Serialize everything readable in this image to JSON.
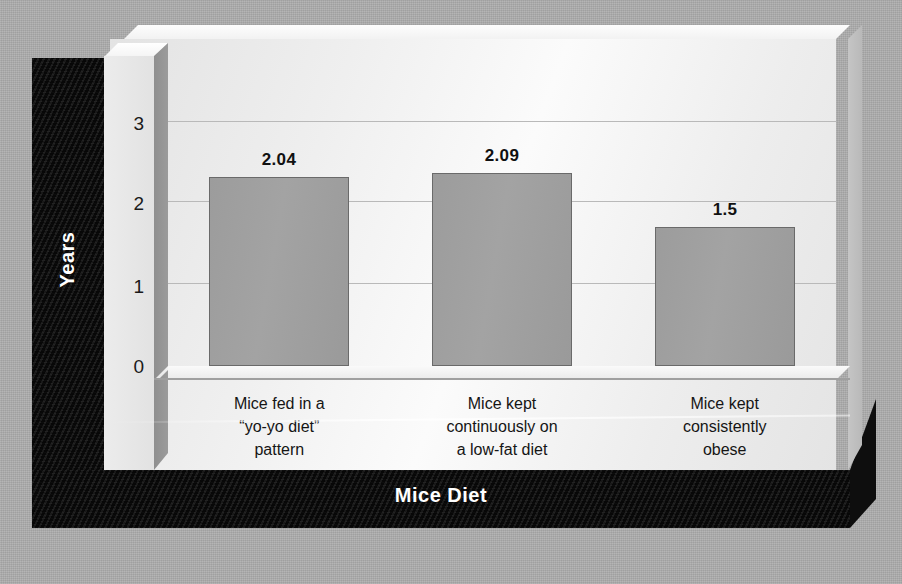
{
  "chart_data": {
    "type": "bar",
    "title": "",
    "xlabel": "Mice Diet",
    "ylabel": "Years",
    "categories": [
      "Mice fed in a\n“yo-yo diet”\npattern",
      "Mice kept\ncontinuously on\na low-fat diet",
      "Mice kept\nconsistently\nobese"
    ],
    "values": [
      2.04,
      2.09,
      1.5
    ],
    "value_labels": [
      "2.04",
      "2.09",
      "1.5"
    ],
    "ylim": [
      0,
      3.35
    ],
    "yticks": [
      "3",
      "2",
      "1",
      "0"
    ],
    "ytick_values": [
      3,
      2,
      1,
      0
    ],
    "grid": true,
    "legend": "none",
    "colors": {
      "bar_fill": "#9e9e9e",
      "bar_outline": "#6a6a6a",
      "panel": "#efefef",
      "band": "#121212",
      "background": "#adadad",
      "gridline": "#b9b9b9",
      "text": "#151515",
      "band_text": "#ffffff"
    }
  },
  "axes": {
    "y_title": "Years",
    "x_title": "Mice Diet",
    "ticks": [
      {
        "label": "3"
      },
      {
        "label": "2"
      },
      {
        "label": "1"
      },
      {
        "label": "0"
      }
    ]
  },
  "bars": [
    {
      "category_line1": "Mice fed in a",
      "category_line2": "“yo-yo diet”",
      "category_line3": "pattern",
      "value_label": "2.04"
    },
    {
      "category_line1": "Mice kept",
      "category_line2": "continuously on",
      "category_line3": "a low-fat diet",
      "value_label": "2.09"
    },
    {
      "category_line1": "Mice kept",
      "category_line2": "consistently",
      "category_line3": "obese",
      "value_label": "1.5"
    }
  ]
}
